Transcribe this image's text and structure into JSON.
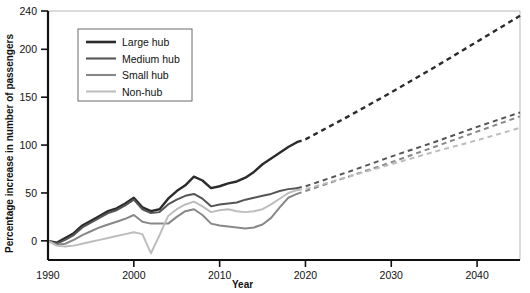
{
  "chart_data": {
    "type": "line",
    "title": "",
    "xlabel": "Year",
    "ylabel": "Percentage increase in number of passengers",
    "xlim": [
      1990,
      2045
    ],
    "ylim": [
      -20,
      240
    ],
    "grid": false,
    "legend_position": "top-left",
    "x_ticks": [
      1990,
      2000,
      2010,
      2020,
      2030,
      2040
    ],
    "y_ticks": [
      0,
      50,
      100,
      150,
      200,
      240
    ],
    "forecast_start_year": 2019,
    "forecast_note": "Dashed segments from 2019 onward are projections",
    "series": [
      {
        "name": "Large hub",
        "color": "#2b2b2b",
        "x": [
          1990,
          1991,
          1992,
          1993,
          1994,
          1995,
          1996,
          1997,
          1998,
          1999,
          2000,
          2001,
          2002,
          2003,
          2004,
          2005,
          2006,
          2007,
          2008,
          2009,
          2010,
          2011,
          2012,
          2013,
          2014,
          2015,
          2016,
          2017,
          2018,
          2019,
          2020,
          2025,
          2030,
          2035,
          2040,
          2045
        ],
        "values": [
          0,
          -2,
          3,
          8,
          16,
          21,
          26,
          31,
          34,
          39,
          45,
          35,
          31,
          33,
          44,
          52,
          58,
          67,
          63,
          55,
          57,
          60,
          62,
          66,
          72,
          80,
          86,
          92,
          98,
          103,
          106,
          130,
          155,
          181,
          208,
          235
        ]
      },
      {
        "name": "Medium hub",
        "color": "#555555",
        "x": [
          1990,
          1991,
          1992,
          1993,
          1994,
          1995,
          1996,
          1997,
          1998,
          1999,
          2000,
          2001,
          2002,
          2003,
          2004,
          2005,
          2006,
          2007,
          2008,
          2009,
          2010,
          2011,
          2012,
          2013,
          2014,
          2015,
          2016,
          2017,
          2018,
          2019,
          2020,
          2025,
          2030,
          2035,
          2040,
          2045
        ],
        "values": [
          0,
          -3,
          1,
          6,
          14,
          19,
          24,
          29,
          32,
          37,
          43,
          33,
          29,
          30,
          38,
          43,
          47,
          49,
          44,
          36,
          38,
          39,
          40,
          43,
          45,
          47,
          49,
          52,
          54,
          55,
          57,
          72,
          88,
          103,
          119,
          134
        ]
      },
      {
        "name": "Small hub",
        "color": "#888888",
        "x": [
          1990,
          1991,
          1992,
          1993,
          1994,
          1995,
          1996,
          1997,
          1998,
          1999,
          2000,
          2001,
          2002,
          2003,
          2004,
          2005,
          2006,
          2007,
          2008,
          2009,
          2010,
          2011,
          2012,
          2013,
          2014,
          2015,
          2016,
          2017,
          2018,
          2019,
          2020,
          2025,
          2030,
          2035,
          2040,
          2045
        ],
        "values": [
          0,
          -4,
          -3,
          1,
          6,
          10,
          14,
          17,
          20,
          23,
          27,
          20,
          18,
          18,
          18,
          25,
          31,
          33,
          27,
          18,
          16,
          15,
          14,
          13,
          14,
          17,
          24,
          35,
          45,
          49,
          52,
          67,
          82,
          98,
          114,
          130
        ]
      },
      {
        "name": "Non-hub",
        "color": "#bdbdbd",
        "x": [
          1990,
          1991,
          1992,
          1993,
          1994,
          1995,
          1996,
          1997,
          1998,
          1999,
          2000,
          2001,
          2002,
          2003,
          2004,
          2005,
          2006,
          2007,
          2008,
          2009,
          2010,
          2011,
          2012,
          2013,
          2014,
          2015,
          2016,
          2017,
          2018,
          2019,
          2020,
          2025,
          2030,
          2035,
          2040,
          2045
        ],
        "values": [
          0,
          -5,
          -6,
          -5,
          -3,
          -1,
          1,
          3,
          5,
          7,
          9,
          7,
          -13,
          6,
          26,
          33,
          38,
          41,
          36,
          30,
          32,
          33,
          31,
          30,
          31,
          33,
          38,
          44,
          50,
          53,
          54,
          67,
          80,
          93,
          105,
          118
        ]
      }
    ]
  },
  "legend": {
    "items": [
      {
        "label": "Large hub"
      },
      {
        "label": "Medium hub"
      },
      {
        "label": "Small hub"
      },
      {
        "label": "Non-hub"
      }
    ]
  },
  "axes": {
    "x_title": "Year",
    "y_title": "Percentage increase in number of passengers",
    "x_tick_labels": [
      "1990",
      "2000",
      "2010",
      "2020",
      "2030",
      "2040"
    ],
    "y_tick_labels": [
      "0",
      "50",
      "100",
      "150",
      "200",
      "240"
    ]
  }
}
